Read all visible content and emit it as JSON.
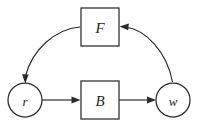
{
  "diagram": {
    "type": "block-diagram",
    "title": "",
    "background_color": "#fefefe",
    "stroke_color": "#2b2b2b",
    "nodes": [
      {
        "id": "r",
        "label": "r",
        "shape": "circle",
        "cx": 25,
        "cy": 100,
        "r": 17
      },
      {
        "id": "B",
        "label": "B",
        "shape": "rect",
        "x": 81,
        "y": 81,
        "w": 38,
        "h": 38
      },
      {
        "id": "w",
        "label": "w",
        "shape": "circle",
        "cx": 173,
        "cy": 100,
        "r": 17
      },
      {
        "id": "F",
        "label": "F",
        "shape": "rect",
        "x": 81,
        "y": 8,
        "w": 38,
        "h": 38
      }
    ],
    "edges": [
      {
        "id": "r-to-B",
        "from": "r",
        "to": "B",
        "style": "straight",
        "label": ""
      },
      {
        "id": "B-to-w",
        "from": "B",
        "to": "w",
        "style": "straight",
        "label": ""
      },
      {
        "id": "w-to-F",
        "from": "w",
        "to": "F",
        "style": "curved",
        "label": ""
      },
      {
        "id": "F-to-r",
        "from": "F",
        "to": "r",
        "style": "curved",
        "label": ""
      }
    ]
  }
}
